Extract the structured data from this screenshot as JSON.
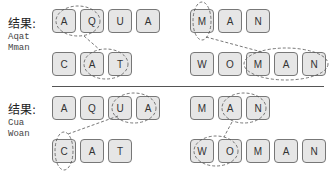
{
  "panels": [
    {
      "label": "结果:",
      "result_lines": [
        "Aqat",
        "Mman"
      ],
      "rows": [
        {
          "letters": [
            "A",
            "Q",
            "U",
            "A"
          ]
        },
        {
          "letters": [
            "C",
            "A",
            "T"
          ]
        },
        {
          "letters": [
            "M",
            "A",
            "N"
          ]
        },
        {
          "letters": [
            "W",
            "O",
            "M",
            "A",
            "N"
          ]
        }
      ]
    },
    {
      "label": "结果:",
      "result_lines": [
        "Cua",
        "Woan"
      ],
      "rows": [
        {
          "letters": [
            "A",
            "Q",
            "U",
            "A"
          ]
        },
        {
          "letters": [
            "C",
            "A",
            "T"
          ]
        },
        {
          "letters": [
            "M",
            "A",
            "N"
          ]
        },
        {
          "letters": [
            "W",
            "O",
            "M",
            "A",
            "N"
          ]
        }
      ]
    }
  ],
  "colors": {
    "box_fill": "#e6e6e6",
    "box_border": "#777777",
    "dash": "#555555"
  }
}
